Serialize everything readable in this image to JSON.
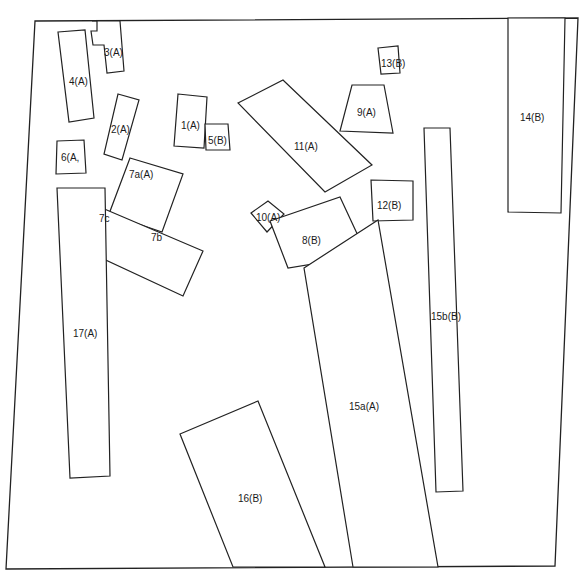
{
  "diagram": {
    "title": "",
    "stroke_color": "#222222",
    "background": "#ffffff",
    "boundary": {
      "name": "site-boundary",
      "points": "35,21 578,18 555,566 6,569"
    },
    "plots": [
      {
        "id": "3A",
        "label": "3(A)",
        "points": "92,21 97,21 97,31 91,31 93,45 104,45 107,73 124,71 120,21",
        "lx": 104,
        "ly": 56
      },
      {
        "id": "4A",
        "label": "4(A)",
        "points": "58,32 85,30 94,118 69,122",
        "lx": 69,
        "ly": 85
      },
      {
        "id": "2A",
        "label": "2(A)",
        "points": "118,94 139,100 122,160 104,154",
        "lx": 111,
        "ly": 133
      },
      {
        "id": "1A",
        "label": "1(A)",
        "points": "178,94 207,97 204,148 174,146",
        "lx": 181,
        "ly": 129
      },
      {
        "id": "5B",
        "label": "5(B)",
        "points": "205,124 228,124 230,150 206,150",
        "lx": 208,
        "ly": 144
      },
      {
        "id": "6A",
        "label": "6(A,",
        "points": "57,141 84,140 86,173 56,174",
        "lx": 61,
        "ly": 161
      },
      {
        "id": "7aA",
        "label": "7a(A)",
        "points": "130,158 183,174 162,232 109,214",
        "lx": 129,
        "ly": 178
      },
      {
        "id": "7bc",
        "label": "",
        "points": "95,205 203,251 183,296 82,249"
      },
      {
        "id": "17A",
        "label": "17(A)",
        "points": "57,188 105,188 110,476 70,478",
        "lx": 73,
        "ly": 337
      },
      {
        "id": "11A",
        "label": "11(A)",
        "points": "238,103 283,80 372,165 325,192",
        "lx": 294,
        "ly": 150
      },
      {
        "id": "9A",
        "label": "9(A)",
        "points": "352,85 384,85 393,133 340,131",
        "lx": 357,
        "ly": 116
      },
      {
        "id": "13B",
        "label": "13(B)",
        "points": "378,48 398,46 400,73 381,74",
        "lx": 381,
        "ly": 67
      },
      {
        "id": "10A",
        "label": "10(A)",
        "points": "251,213 268,201 284,214 267,232",
        "lx": 256,
        "ly": 221
      },
      {
        "id": "8B",
        "label": "8(B)",
        "points": "270,221 340,197 367,255 288,268",
        "lx": 302,
        "ly": 244
      },
      {
        "id": "12B",
        "label": "12(B)",
        "points": "371,180 413,181 413,220 373,221",
        "lx": 377,
        "ly": 209
      },
      {
        "id": "14B",
        "label": "14(B)",
        "points": "508,18 565,18 561,213 508,212",
        "lx": 520,
        "ly": 121
      },
      {
        "id": "15bB",
        "label": "15b(B)",
        "points": "424,128 450,128 463,491 436,492",
        "lx": 431,
        "ly": 320
      },
      {
        "id": "15aA",
        "label": "15a(A)",
        "points": "304,268 378,220 438,567 353,567",
        "lx": 349,
        "ly": 410
      },
      {
        "id": "16B",
        "label": "16(B)",
        "points": "180,434 258,401 325,567 233,567",
        "lx": 238,
        "ly": 502
      }
    ],
    "sublabels": [
      {
        "id": "7c",
        "label": "7c",
        "x": 99,
        "y": 222
      },
      {
        "id": "7b",
        "label": "7b",
        "x": 151,
        "y": 241
      }
    ]
  }
}
